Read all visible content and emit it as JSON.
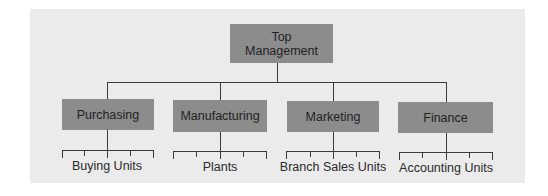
{
  "diagram": {
    "type": "org-chart",
    "root": {
      "label_line1": "Top",
      "label_line2": "Management"
    },
    "departments": [
      {
        "label": "Purchasing",
        "sub_units": "Buying Units"
      },
      {
        "label": "Manufacturing",
        "sub_units": "Plants"
      },
      {
        "label": "Marketing",
        "sub_units": "Branch Sales Units"
      },
      {
        "label": "Finance",
        "sub_units": "Accounting Units"
      }
    ]
  },
  "colors": {
    "panel_bg": "#ebebeb",
    "box_fill": "#8c8c8c",
    "line": "#3a3a3a",
    "text": "#1f1f1f"
  }
}
